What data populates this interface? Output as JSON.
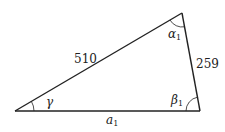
{
  "diagram": {
    "type": "triangle",
    "vertices": {
      "bottom_left": [
        15,
        111
      ],
      "bottom_right": [
        200,
        111
      ],
      "top": [
        182,
        13
      ]
    },
    "sides": {
      "left_side_label": "510",
      "right_side_label": "259",
      "bottom_side_label": "a",
      "bottom_side_subscript": "1"
    },
    "angles": {
      "top_label": "α",
      "top_subscript": "1",
      "bottom_right_label": "β",
      "bottom_right_subscript": "1",
      "bottom_left_label": "γ"
    },
    "stroke_color": "#222222",
    "background": "#ffffff"
  }
}
